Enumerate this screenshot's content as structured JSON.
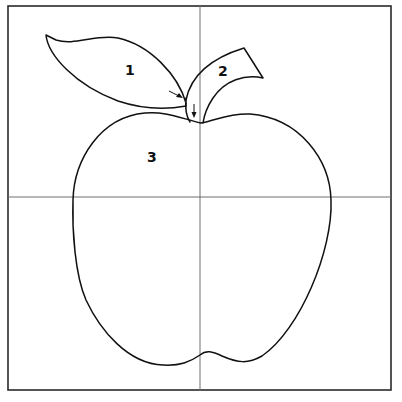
{
  "diagram": {
    "regions": [
      {
        "id": "leaf-left",
        "label": "1"
      },
      {
        "id": "leaf-right",
        "label": "2"
      },
      {
        "id": "apple-body",
        "label": "3"
      }
    ],
    "annotations": [
      {
        "id": "arrow-to-stem-side",
        "direction": "diagonal-right-down"
      },
      {
        "id": "arrow-to-stem-base",
        "direction": "down"
      }
    ],
    "guides": {
      "vertical_center": true,
      "horizontal_center": true
    },
    "colors": {
      "stroke": "#111111",
      "frame": "#2a2a2a",
      "guide": "#6e6e6e",
      "background": "#ffffff"
    }
  }
}
